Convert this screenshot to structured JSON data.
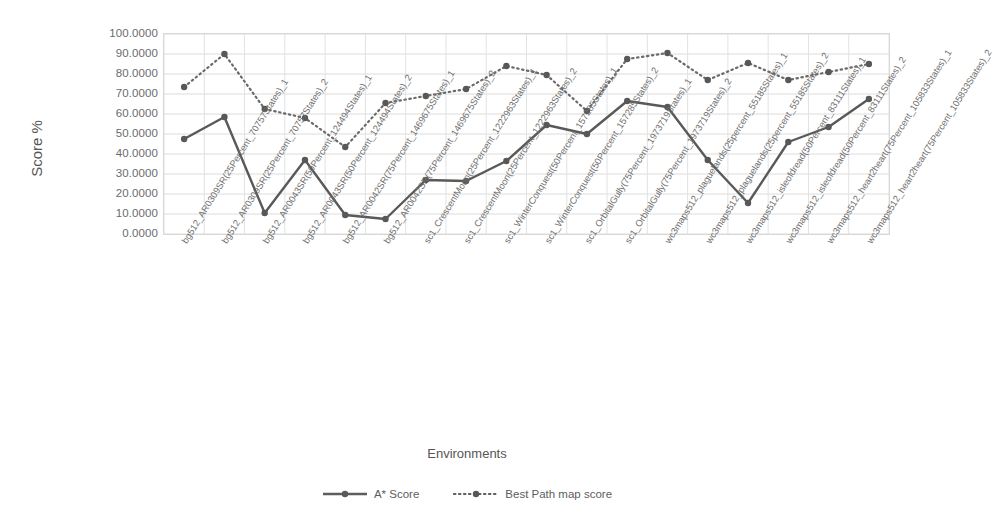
{
  "chart_data": {
    "type": "line",
    "title": "",
    "xlabel": "Environments",
    "ylabel": "Score %",
    "ylim": [
      0,
      100
    ],
    "ytick_labels": [
      "100.0000",
      "90.0000",
      "80.0000",
      "70.0000",
      "60.0000",
      "50.0000",
      "40.0000",
      "30.0000",
      "20.0000",
      "10.0000",
      "0.0000"
    ],
    "ytick_values": [
      100,
      90,
      80,
      70,
      60,
      50,
      40,
      30,
      20,
      10,
      0
    ],
    "grid": true,
    "legend_position": "bottom",
    "categories": [
      "bg512_AR0309SR(25Percent_70757States)_1",
      "bg512_AR0309SR(25Percent_70757States)_2",
      "bg512_AR0043SR(50Percent_124494States)_1",
      "bg512_AR0043SR(50Percent_124494States)_2",
      "bg512_AR0042SR(75Percent_1469675States)_1",
      "bg512_AR0042SR(75Percent_1469675States)_2",
      "sc1_CrescentMoon(25Percent_1222963States)_1",
      "sc1_CrescentMoon(25Percent_1222963States)_2",
      "sc1_WinterConquest(50Percent_157285States)_1",
      "sc1_WinterConquest(50Percent_157285States)_2",
      "sc1_OrbitalGully(75Percent_1973719States)_1",
      "sc1_OrbitalGully(75Percent_1973719States)_2",
      "wc3maps512_plaguelands(25percent_55185States)_1",
      "wc3maps512_plaguelands(25percent_55185States)_2",
      "wc3maps512_isleofdread(50Percent_83111States)_1",
      "wc3maps512_isleofdread(50Percent_83111States)_2",
      "wc3maps512_heart2heart(75Percent_105833States)_1",
      "wc3maps512_heart2heart(75Percent_105833States)_2"
    ],
    "series": [
      {
        "name": "A* Score",
        "style": "solid",
        "color": "#595959",
        "values": [
          47.5,
          58.5,
          10.5,
          37.0,
          9.5,
          7.5,
          27.0,
          26.5,
          36.5,
          54.5,
          50.0,
          66.5,
          63.5,
          37.0,
          15.5,
          46.0,
          53.5,
          67.5
        ]
      },
      {
        "name": "Best Path map score",
        "style": "dotted",
        "color": "#6a6a6a",
        "values": [
          73.5,
          90.0,
          62.5,
          58.0,
          43.5,
          65.5,
          69.0,
          72.5,
          84.0,
          79.5,
          61.5,
          87.5,
          90.5,
          77.0,
          85.5,
          77.0,
          81.0,
          85.0
        ]
      }
    ]
  },
  "legend": {
    "items": [
      {
        "label": "A* Score",
        "style": "solid"
      },
      {
        "label": "Best Path map score",
        "style": "dotted"
      }
    ]
  }
}
